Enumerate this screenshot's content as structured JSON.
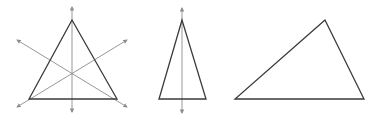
{
  "diagram": {
    "title": "",
    "colors": {
      "background": "#ffffff",
      "triangle_stroke": "#3a3a3a",
      "symmetry_line": "#8c8c8c"
    },
    "figures": [
      {
        "name": "equilateral-triangle",
        "vertices": [
          [
            72,
            20
          ],
          [
            29,
            99
          ],
          [
            117,
            99
          ]
        ],
        "symmetry_lines": [
          {
            "from": [
              72,
              112
            ],
            "to": [
              72,
              7
            ],
            "arrows": "both"
          },
          {
            "from": [
              17,
              40
            ],
            "to": [
              127,
              107
            ],
            "arrows": "both"
          },
          {
            "from": [
              127,
              40
            ],
            "to": [
              17,
              107
            ],
            "arrows": "both"
          }
        ]
      },
      {
        "name": "isosceles-triangle",
        "vertices": [
          [
            182,
            20
          ],
          [
            159,
            99
          ],
          [
            206,
            99
          ]
        ],
        "symmetry_lines": [
          {
            "from": [
              182,
              113
            ],
            "to": [
              182,
              8
            ],
            "arrows": "both"
          }
        ]
      },
      {
        "name": "scalene-triangle",
        "vertices": [
          [
            325,
            20
          ],
          [
            235,
            99
          ],
          [
            364,
            99
          ]
        ],
        "symmetry_lines": []
      }
    ]
  }
}
